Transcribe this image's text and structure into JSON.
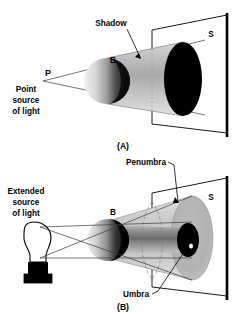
{
  "figure": {
    "background_color": "#ffffff",
    "ink_color": "#000000",
    "panels": [
      {
        "id": "A",
        "caption": "(A)",
        "source_label": "P",
        "source_description": "Point source of light",
        "source_description_lines": [
          "Point",
          "source",
          "of light"
        ],
        "object_label": "B",
        "screen_label": "S",
        "shadow_label": "Shadow",
        "region_labels": [
          "Shadow"
        ],
        "source_type": "point"
      },
      {
        "id": "B",
        "caption": "(B)",
        "source_description": "Extended source of light",
        "source_description_lines": [
          "Extended",
          "source",
          "of light"
        ],
        "object_label": "B",
        "screen_label": "S",
        "penumbra_label": "Penumbra",
        "umbra_label": "Umbra",
        "region_labels": [
          "Penumbra",
          "Umbra"
        ],
        "source_type": "extended"
      }
    ],
    "colors": {
      "umbra": "#000000",
      "penumbra": "#b4b4b4",
      "shadow_cone": "#c9c9c9",
      "screen": "#ffffff",
      "ray": "#3a3a3a",
      "bulb_base": "#000000",
      "bulb_glass": "#ffffff"
    }
  }
}
